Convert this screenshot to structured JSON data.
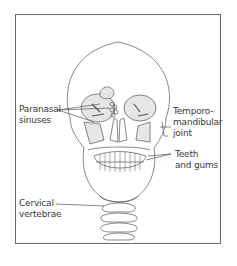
{
  "figure": {
    "labels": {
      "paranasal_1": "Paranasal",
      "paranasal_2": "sinuses",
      "tmj_1": "Temporo-",
      "tmj_2": "mandibular",
      "tmj_3": "joint",
      "teeth_1": "Teeth",
      "teeth_2": "and gums",
      "cervical_1": "Cervical",
      "cervical_2": "vertebrae"
    },
    "colors": {
      "frame": "#6a6a6a",
      "line": "#555555",
      "fill": "#e6e6e6",
      "text": "#3a3a3a"
    }
  }
}
